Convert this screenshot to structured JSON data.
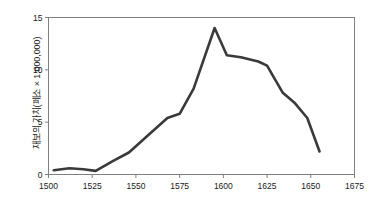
{
  "chart_data": {
    "type": "line",
    "title": "",
    "xlabel": "",
    "ylabel": "재보의 가치(페소 × 1,000,000)",
    "xlim": [
      1500,
      1675
    ],
    "ylim": [
      0,
      15
    ],
    "xticks": [
      1500,
      1525,
      1550,
      1575,
      1600,
      1625,
      1650,
      1675
    ],
    "yticks": [
      0,
      5,
      10,
      15
    ],
    "grid": false,
    "legend": "none",
    "line_color": "#3a3a3a",
    "series": [
      {
        "name": "재보의 가치",
        "x": [
          1503,
          1512,
          1520,
          1527,
          1537,
          1546,
          1556,
          1568,
          1575,
          1583,
          1595,
          1602,
          1610,
          1620,
          1625,
          1634,
          1641,
          1648,
          1655
        ],
        "values": [
          0.4,
          0.6,
          0.5,
          0.35,
          1.3,
          2.1,
          3.6,
          5.4,
          5.8,
          8.2,
          14.0,
          11.4,
          11.2,
          10.8,
          10.4,
          7.8,
          6.8,
          5.4,
          2.2
        ]
      }
    ]
  },
  "axis": {
    "xtick_labels": [
      "1500",
      "1525",
      "1550",
      "1575",
      "1600",
      "1625",
      "1650",
      "1675"
    ],
    "ytick_labels": [
      "0",
      "5",
      "10",
      "15"
    ]
  }
}
